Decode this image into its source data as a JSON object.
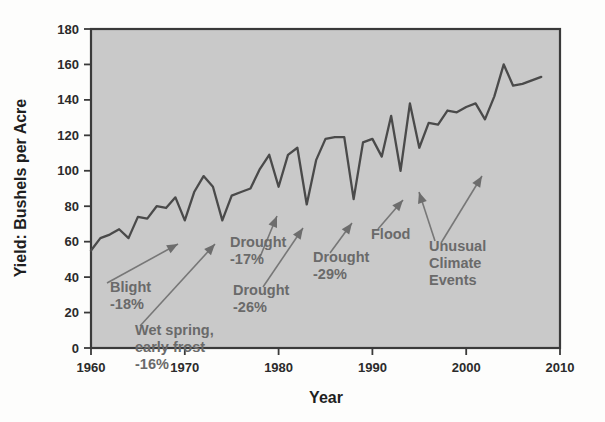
{
  "figure": {
    "background_color": "#fdfdfc",
    "plot_background_color": "#c9c9c9",
    "line_color": "#4a4a4a",
    "annotation_color": "#6a6a6a",
    "axis_color": "#3a3a3a"
  },
  "chart_data": {
    "type": "line",
    "title": "",
    "subtitle": "",
    "xlabel": "Year",
    "ylabel": "Yield: Bushels per Acre",
    "xlim": [
      1960,
      2010
    ],
    "ylim": [
      0,
      180
    ],
    "xticks": [
      1960,
      1970,
      1980,
      1990,
      2000,
      2010
    ],
    "xtick_labels": [
      "1960",
      "1970",
      "1980",
      "1990",
      "2000",
      "2010"
    ],
    "yticks": [
      0,
      20,
      40,
      60,
      80,
      100,
      120,
      140,
      160,
      180
    ],
    "ytick_labels": [
      "0",
      "20",
      "40",
      "60",
      "80",
      "100",
      "120",
      "140",
      "160",
      "180"
    ],
    "grid": false,
    "legend": null,
    "legend_position": "none",
    "series": [
      {
        "name": "Yield",
        "x": [
          1960,
          1961,
          1962,
          1963,
          1964,
          1965,
          1966,
          1967,
          1968,
          1969,
          1970,
          1971,
          1972,
          1973,
          1974,
          1975,
          1976,
          1977,
          1978,
          1979,
          1980,
          1981,
          1982,
          1983,
          1984,
          1985,
          1986,
          1987,
          1988,
          1989,
          1990,
          1991,
          1992,
          1993,
          1994,
          1995,
          1996,
          1997,
          1998,
          1999,
          2000,
          2001,
          2002,
          2003,
          2004,
          2005,
          2006,
          2007,
          2008
        ],
        "values": [
          55,
          62,
          64,
          67,
          62,
          74,
          73,
          80,
          79,
          85,
          72,
          88,
          97,
          91,
          72,
          86,
          88,
          90,
          101,
          109,
          91,
          109,
          113,
          81,
          106,
          118,
          119,
          119,
          84,
          116,
          118,
          108,
          131,
          100,
          138,
          113,
          127,
          126,
          134,
          133,
          136,
          138,
          129,
          142,
          160,
          148,
          149,
          151,
          153
        ]
      }
    ],
    "annotations": [
      {
        "id": "blight",
        "label": "Blight\n-18%",
        "lines": [
          "Blight",
          "-18%"
        ],
        "target_year": 1970,
        "target_value": 72,
        "drop_percent": -18
      },
      {
        "id": "wet-spring-early-frost",
        "label": "Wet spring,\nearly frost\n-16%",
        "lines": [
          "Wet spring,",
          "early frost",
          "-16%"
        ],
        "target_year": 1974,
        "target_value": 72,
        "drop_percent": -16
      },
      {
        "id": "drought-17",
        "label": "Drought\n-17%",
        "lines": [
          "Drought",
          "-17%"
        ],
        "target_year": 1980,
        "target_value": 91,
        "drop_percent": -17
      },
      {
        "id": "drought-26",
        "label": "Drought\n-26%",
        "lines": [
          "Drought",
          "-26%"
        ],
        "target_year": 1983,
        "target_value": 81,
        "drop_percent": -26
      },
      {
        "id": "drought-29",
        "label": "Drought\n-29%",
        "lines": [
          "Drought",
          "-29%"
        ],
        "target_year": 1988,
        "target_value": 84,
        "drop_percent": -29
      },
      {
        "id": "flood",
        "label": "Flood",
        "lines": [
          "Flood"
        ],
        "target_year": 1993,
        "target_value": 100,
        "drop_percent": null
      },
      {
        "id": "unusual-climate-events-1",
        "label": "Unusual\nClimate\nEvents",
        "lines": [
          "Unusual",
          "Climate",
          "Events"
        ],
        "target_year": 1995,
        "target_value": 113,
        "drop_percent": null
      },
      {
        "id": "unusual-climate-events-2",
        "label": "",
        "lines": [],
        "target_year": 2002,
        "target_value": 129,
        "drop_percent": null
      }
    ]
  }
}
